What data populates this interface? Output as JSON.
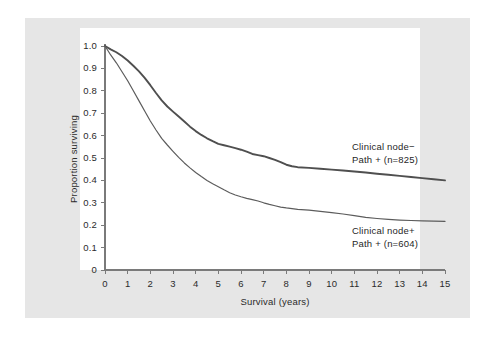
{
  "figure": {
    "background_color": "#ffffff",
    "panel_color": "#e6e6e6",
    "plot_background_color": "#ffffff",
    "axis_color": "#7a7a7a",
    "text_color": "#2b2b2b"
  },
  "chart_data": {
    "type": "line",
    "title": "",
    "subtitle": "",
    "xlabel": "Survival (years)",
    "ylabel": "Proportion surviving",
    "xlim": [
      0,
      15
    ],
    "ylim": [
      0,
      1.0
    ],
    "grid": false,
    "legend_position": "inline-annotation",
    "xticks": [
      "0",
      "1",
      "2",
      "3",
      "4",
      "5",
      "6",
      "7",
      "8",
      "9",
      "10",
      "11",
      "12",
      "13",
      "14",
      "15"
    ],
    "yticks": [
      "0",
      "0.1",
      "0.2",
      "0.3",
      "0.4",
      "0.5",
      "0.6",
      "0.7",
      "0.8",
      "0.9",
      "1.0"
    ],
    "xtick_values": [
      0,
      1,
      2,
      3,
      4,
      5,
      6,
      7,
      8,
      9,
      10,
      11,
      12,
      13,
      14,
      15
    ],
    "ytick_values": [
      0,
      0.1,
      0.2,
      0.3,
      0.4,
      0.5,
      0.6,
      0.7,
      0.8,
      0.9,
      1.0
    ],
    "series": [
      {
        "name": "Clinical node- Path + (n=825)",
        "label_line1": "Clinical node−",
        "label_line2": "Path + (n=825)",
        "color": "#4f4f4f",
        "line_width": 1.9,
        "n": 825,
        "x": [
          0,
          0.25,
          0.5,
          0.75,
          1.0,
          1.25,
          1.5,
          1.75,
          2.0,
          2.25,
          2.5,
          2.75,
          3.0,
          3.25,
          3.5,
          3.75,
          4.0,
          4.25,
          4.5,
          4.75,
          5.0,
          5.25,
          5.5,
          5.75,
          6.0,
          6.25,
          6.5,
          6.75,
          7.0,
          7.25,
          7.5,
          7.75,
          8.0,
          8.25,
          8.5,
          9.0,
          9.5,
          10.0,
          10.5,
          11.0,
          11.5,
          12.0,
          12.5,
          13.0,
          13.5,
          14.0,
          14.5,
          15.0
        ],
        "y": [
          1.0,
          0.985,
          0.972,
          0.955,
          0.935,
          0.912,
          0.887,
          0.858,
          0.825,
          0.79,
          0.757,
          0.73,
          0.707,
          0.685,
          0.663,
          0.64,
          0.62,
          0.603,
          0.588,
          0.575,
          0.563,
          0.557,
          0.551,
          0.544,
          0.537,
          0.528,
          0.518,
          0.513,
          0.508,
          0.5,
          0.492,
          0.482,
          0.47,
          0.463,
          0.459,
          0.456,
          0.452,
          0.448,
          0.444,
          0.44,
          0.435,
          0.43,
          0.425,
          0.42,
          0.415,
          0.41,
          0.405,
          0.4
        ]
      },
      {
        "name": "Clinical node+ Path + (n=604)",
        "label_line1": "Clinical node+",
        "label_line2": "Path + (n=604)",
        "color": "#5c5c5c",
        "line_width": 1.2,
        "n": 604,
        "x": [
          0,
          0.25,
          0.5,
          0.75,
          1.0,
          1.25,
          1.5,
          1.75,
          2.0,
          2.25,
          2.5,
          2.75,
          3.0,
          3.25,
          3.5,
          3.75,
          4.0,
          4.25,
          4.5,
          4.75,
          5.0,
          5.25,
          5.5,
          5.75,
          6.0,
          6.25,
          6.5,
          6.75,
          7.0,
          7.25,
          7.5,
          7.75,
          8.0,
          8.5,
          9.0,
          9.5,
          10.0,
          10.5,
          11.0,
          11.5,
          12.0,
          12.5,
          13.0,
          13.5,
          14.0,
          14.5,
          15.0
        ],
        "y": [
          1.0,
          0.96,
          0.925,
          0.885,
          0.845,
          0.8,
          0.755,
          0.71,
          0.665,
          0.625,
          0.588,
          0.558,
          0.53,
          0.503,
          0.478,
          0.456,
          0.435,
          0.417,
          0.4,
          0.385,
          0.372,
          0.358,
          0.345,
          0.335,
          0.327,
          0.32,
          0.314,
          0.308,
          0.3,
          0.293,
          0.287,
          0.281,
          0.277,
          0.271,
          0.267,
          0.262,
          0.256,
          0.25,
          0.243,
          0.235,
          0.23,
          0.226,
          0.223,
          0.221,
          0.219,
          0.218,
          0.217
        ]
      }
    ]
  }
}
